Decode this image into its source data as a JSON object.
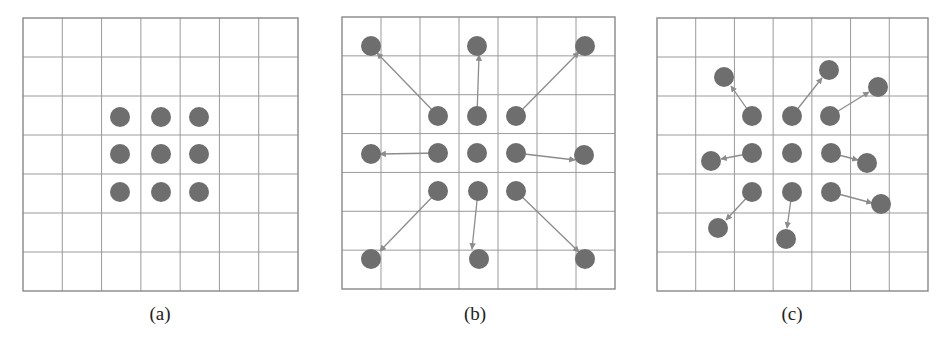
{
  "figure": {
    "colors": {
      "grid": "#9a9a9a",
      "border": "#888888",
      "dot": "#6e6e6e",
      "arrow": "#8c8c8c",
      "label": "#222222"
    },
    "grid": {
      "rows": 7,
      "cols": 7
    },
    "dot_radius": 10,
    "panels": [
      {
        "id": "a",
        "label": "(a)",
        "grid_box": {
          "x": 23,
          "y": 18,
          "w": 275,
          "h": 273
        },
        "label_pos": {
          "x": 160,
          "y": 320
        },
        "dots": [
          [
            120,
            117
          ],
          [
            161,
            117
          ],
          [
            199,
            117
          ],
          [
            120,
            154
          ],
          [
            161,
            154
          ],
          [
            199,
            154
          ],
          [
            120,
            192
          ],
          [
            161,
            192
          ],
          [
            199,
            192
          ]
        ],
        "arrows": []
      },
      {
        "id": "b",
        "label": "(b)",
        "grid_box": {
          "x": 342,
          "y": 17,
          "w": 273,
          "h": 272
        },
        "label_pos": {
          "x": 475,
          "y": 320
        },
        "dots": [
          [
            438,
            116
          ],
          [
            477,
            116
          ],
          [
            516,
            116
          ],
          [
            438,
            153
          ],
          [
            477,
            153
          ],
          [
            516,
            153
          ],
          [
            438,
            191
          ],
          [
            478,
            191
          ],
          [
            516,
            191
          ],
          [
            371,
            46
          ],
          [
            477,
            46
          ],
          [
            585,
            46
          ],
          [
            371,
            154
          ],
          [
            584,
            155
          ],
          [
            371,
            259
          ],
          [
            479,
            259
          ],
          [
            585,
            259
          ]
        ],
        "arrows": [
          {
            "from": [
              438,
              116
            ],
            "to": [
              377,
              53
            ]
          },
          {
            "from": [
              477,
              116
            ],
            "to": [
              479,
              55
            ]
          },
          {
            "from": [
              516,
              116
            ],
            "to": [
              579,
              52
            ]
          },
          {
            "from": [
              438,
              153
            ],
            "to": [
              380,
              154
            ]
          },
          {
            "from": [
              516,
              153
            ],
            "to": [
              575,
              160
            ]
          },
          {
            "from": [
              438,
              191
            ],
            "to": [
              380,
              251
            ]
          },
          {
            "from": [
              478,
              191
            ],
            "to": [
              472,
              249
            ]
          },
          {
            "from": [
              516,
              191
            ],
            "to": [
              579,
              252
            ]
          }
        ]
      },
      {
        "id": "c",
        "label": "(c)",
        "grid_box": {
          "x": 657,
          "y": 18,
          "w": 271,
          "h": 273
        },
        "label_pos": {
          "x": 792,
          "y": 320
        },
        "dots": [
          [
            752,
            116
          ],
          [
            792,
            116
          ],
          [
            830,
            116
          ],
          [
            752,
            153
          ],
          [
            792,
            153
          ],
          [
            831,
            153
          ],
          [
            752,
            192
          ],
          [
            792,
            192
          ],
          [
            831,
            192
          ],
          [
            724,
            77
          ],
          [
            829,
            70
          ],
          [
            878,
            87
          ],
          [
            711,
            161
          ],
          [
            867,
            163
          ],
          [
            881,
            204
          ],
          [
            718,
            228
          ],
          [
            786,
            239
          ]
        ],
        "arrows": [
          {
            "from": [
              752,
              116
            ],
            "to": [
              731,
              86
            ]
          },
          {
            "from": [
              792,
              116
            ],
            "to": [
              822,
              78
            ]
          },
          {
            "from": [
              830,
              116
            ],
            "to": [
              869,
              92
            ]
          },
          {
            "from": [
              752,
              153
            ],
            "to": [
              721,
              159
            ]
          },
          {
            "from": [
              831,
              153
            ],
            "to": [
              858,
              160
            ]
          },
          {
            "from": [
              831,
              192
            ],
            "to": [
              872,
              203
            ]
          },
          {
            "from": [
              752,
              192
            ],
            "to": [
              726,
              220
            ]
          },
          {
            "from": [
              792,
              192
            ],
            "to": [
              787,
              228
            ]
          }
        ]
      }
    ]
  }
}
